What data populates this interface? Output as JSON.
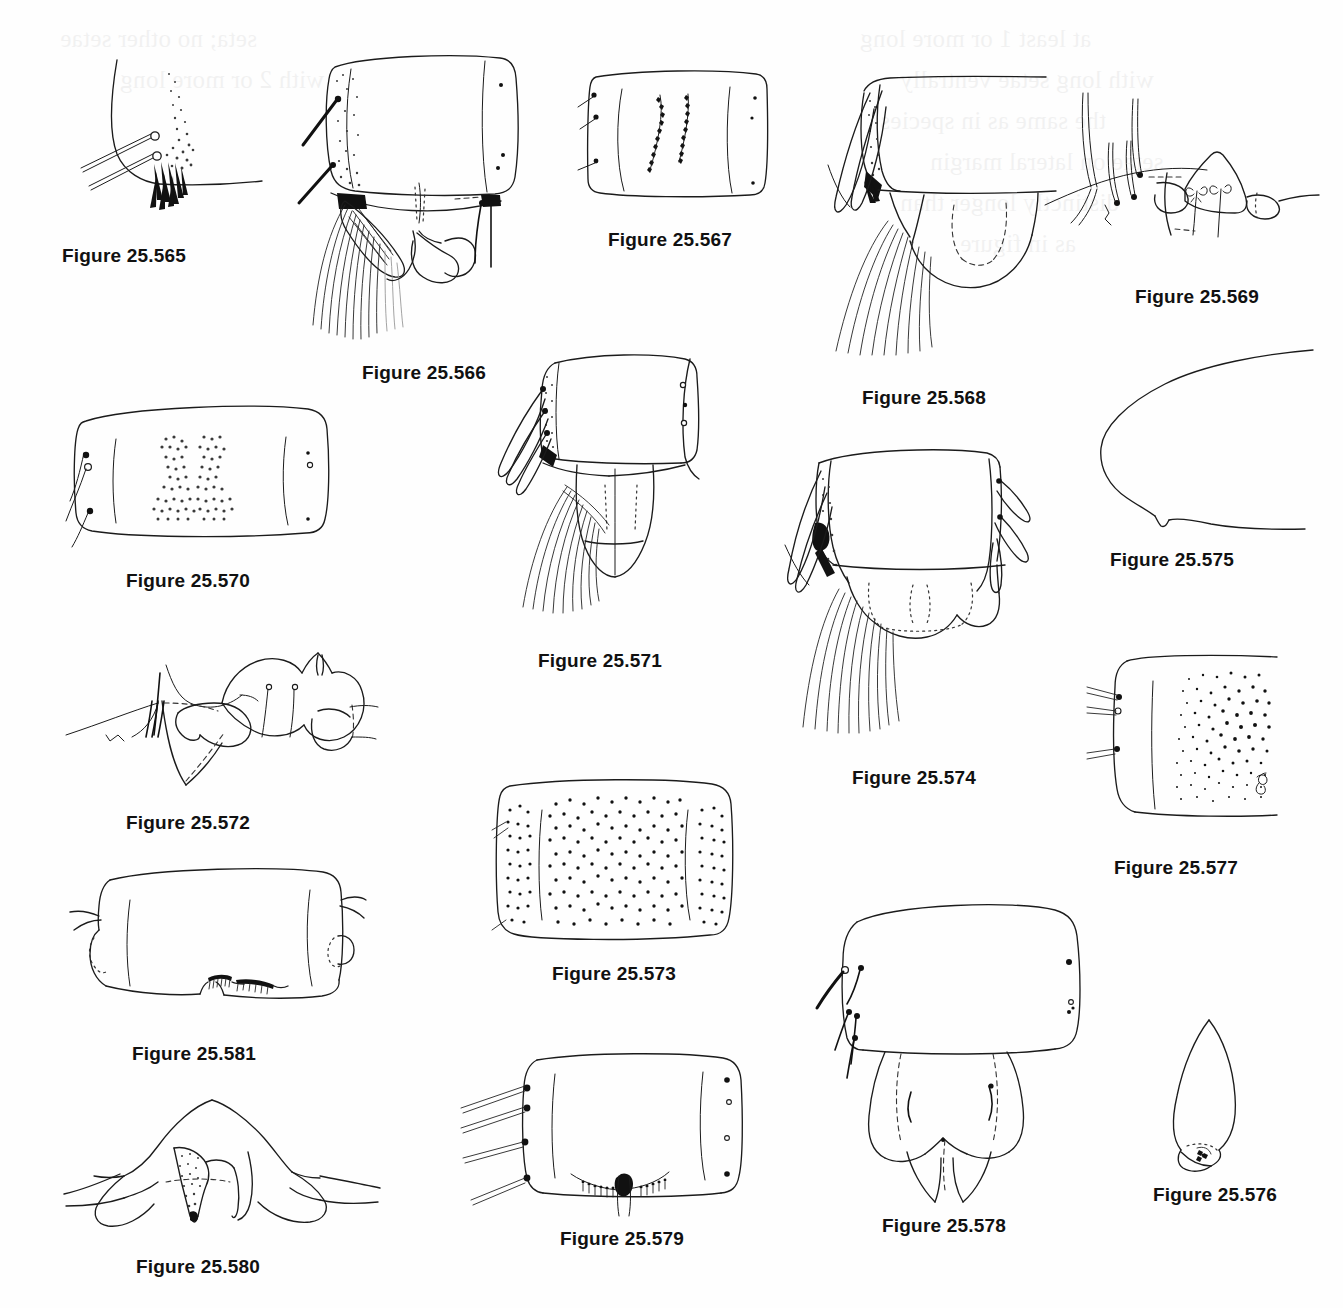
{
  "plate": {
    "title": "Taxonomic illustration plate — Figures 25.565 through 25.581",
    "kind": "line-drawing figure plate",
    "background_color": "#ffffff",
    "ink_color": "#1b1b1b",
    "caption_color": "#111111",
    "width": 1343,
    "height": 1308,
    "ghost_text_note": "faint mirrored bleed-through text from reverse page"
  },
  "figures": [
    {
      "id": "fig-25-565",
      "caption": "Figure 25.565",
      "subject": "lateral body margin with two stalked setae and dark spinule patch",
      "caption_x": 62,
      "caption_y": 245,
      "box_x": 60,
      "box_y": 60,
      "box_w": 190,
      "box_h": 180
    },
    {
      "id": "fig-25-566",
      "caption": "Figure 25.566",
      "subject": "abdominal segment with stippled lateral area, setal comb and paired terminal lobes",
      "caption_x": 362,
      "caption_y": 362,
      "box_x": 300,
      "box_y": 50,
      "box_w": 250,
      "box_h": 300
    },
    {
      "id": "fig-25-567",
      "caption": "Figure 25.567",
      "subject": "rectangular sclerite with two curved rows of denticles",
      "caption_x": 608,
      "caption_y": 229,
      "box_x": 580,
      "box_y": 70,
      "box_w": 190,
      "box_h": 135
    },
    {
      "id": "fig-25-568",
      "caption": "Figure 25.568",
      "subject": "segment with stippled lateral lobe, long setal fan and dashed internal outline",
      "caption_x": 862,
      "caption_y": 387,
      "box_x": 830,
      "box_y": 55,
      "box_w": 230,
      "box_h": 310
    },
    {
      "id": "fig-25-569",
      "caption": "Figure 25.569",
      "subject": "lateral margin with four long setae and pair of apically-branched sensilla on a pointed lobe",
      "caption_x": 1135,
      "caption_y": 286,
      "box_x": 1040,
      "box_y": 60,
      "box_w": 290,
      "box_h": 200
    },
    {
      "id": "fig-25-570",
      "caption": "Figure 25.570",
      "subject": "broad rectangular tergite with hourglass-shaped stippled median patch",
      "caption_x": 126,
      "caption_y": 570,
      "box_x": 68,
      "box_y": 395,
      "box_w": 270,
      "box_h": 150
    },
    {
      "id": "fig-25-571",
      "caption": "Figure 25.571",
      "subject": "terminal segment with lateral setal fan, subapical spines and paired rounded lobes",
      "caption_x": 538,
      "caption_y": 650,
      "box_x": 490,
      "box_y": 350,
      "box_w": 240,
      "box_h": 290
    },
    {
      "id": "fig-25-572",
      "caption": "Figure 25.572",
      "subject": "lateral aspect of genitalic structures with dashed internal outlines and peg setae",
      "caption_x": 126,
      "caption_y": 812,
      "box_x": 70,
      "box_y": 630,
      "box_w": 310,
      "box_h": 170
    },
    {
      "id": "fig-25-573",
      "caption": "Figure 25.573",
      "subject": "rectangular tergite densely covered with short spinules between two lateral lines",
      "caption_x": 552,
      "caption_y": 963,
      "box_x": 488,
      "box_y": 775,
      "box_w": 255,
      "box_h": 170
    },
    {
      "id": "fig-25-574",
      "caption": "Figure 25.574",
      "subject": "segment with dark stippled lateral lobe, spines, long seta row and dotted internal outline",
      "caption_x": 852,
      "caption_y": 767,
      "box_x": 790,
      "box_y": 440,
      "box_w": 250,
      "box_h": 310
    },
    {
      "id": "fig-25-575",
      "caption": "Figure 25.575",
      "subject": "simple outline of rounded apical lobe with small ventral notch",
      "caption_x": 1110,
      "caption_y": 549,
      "box_x": 1060,
      "box_y": 340,
      "box_w": 250,
      "box_h": 190
    },
    {
      "id": "fig-25-576",
      "caption": "Figure 25.576",
      "subject": "elongate narrow lobe with small dark apical sensory pit",
      "caption_x": 1153,
      "caption_y": 1184,
      "box_x": 1165,
      "box_y": 1020,
      "box_w": 90,
      "box_h": 145
    },
    {
      "id": "fig-25-577",
      "caption": "Figure 25.577",
      "subject": "sclerite with three lateral setae and dense graded stippled field",
      "caption_x": 1114,
      "caption_y": 857,
      "box_x": 1095,
      "box_y": 650,
      "box_w": 160,
      "box_h": 175
    },
    {
      "id": "fig-25-578",
      "caption": "Figure 25.578",
      "subject": "segment with lateral setae and bilobed ventral plate with dashed sutures and pointed apices",
      "caption_x": 882,
      "caption_y": 1215,
      "box_x": 800,
      "box_y": 895,
      "box_w": 290,
      "box_h": 300
    },
    {
      "id": "fig-25-579",
      "caption": "Figure 25.579",
      "subject": "squarish sclerite with four long lateral setae and median ventral denticle patches",
      "caption_x": 560,
      "caption_y": 1228,
      "box_x": 460,
      "box_y": 1055,
      "box_w": 285,
      "box_h": 155
    },
    {
      "id": "fig-25-580",
      "caption": "Figure 25.580",
      "subject": "median triangular stippled process flanked by two rounded lateral arms",
      "caption_x": 136,
      "caption_y": 1256,
      "box_x": 70,
      "box_y": 1095,
      "box_w": 300,
      "box_h": 140
    },
    {
      "id": "fig-25-581",
      "caption": "Figure 25.581",
      "subject": "broad rectangular sclerite with rounded lateral projections and two ventral denticle combs",
      "caption_x": 132,
      "caption_y": 1043,
      "box_x": 78,
      "box_y": 865,
      "box_w": 270,
      "box_h": 145
    }
  ],
  "ghost_text": {
    "lines": [
      "seta; no other setae",
      "with 2 or more long",
      "at least 1 or more long",
      "with long setae ventrally",
      "the same as in species",
      "setae on lateral margin",
      "distinctly longer than",
      "as in figure"
    ]
  }
}
